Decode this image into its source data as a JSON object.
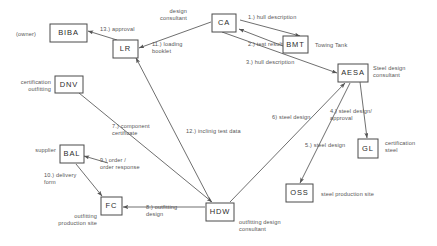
{
  "diagram": {
    "type": "node-link-diagram",
    "canvas": {
      "width": 437,
      "height": 246
    },
    "colors": {
      "background": "#ffffff",
      "node_stroke": "#4a4a4a",
      "node_fill": "#ffffff",
      "edge": "#555555",
      "text": "#555555",
      "node_text": "#2b2b2b"
    },
    "nodes": [
      {
        "id": "biba",
        "label": "BIBA",
        "role": "(owner)",
        "x": 50,
        "y": 24,
        "w": 37,
        "h": 18,
        "role_x": 16,
        "role_y": 36,
        "role_anchor": "start"
      },
      {
        "id": "lr",
        "label": "LR",
        "role": "",
        "x": 113,
        "y": 40,
        "w": 25,
        "h": 18,
        "role_x": 0,
        "role_y": 0,
        "role_anchor": "start"
      },
      {
        "id": "ca",
        "label": "CA",
        "role": "design\nconsultant",
        "x": 212,
        "y": 14,
        "w": 24,
        "h": 18,
        "role_x": 187,
        "role_y": 13,
        "role_anchor": "end"
      },
      {
        "id": "bmt",
        "label": "BMT",
        "role": "Towing Tank",
        "x": 283,
        "y": 36,
        "w": 25,
        "h": 17,
        "role_x": 315,
        "role_y": 47,
        "role_anchor": "start"
      },
      {
        "id": "aesa",
        "label": "AESA",
        "role": "Steel design\nconsultant",
        "x": 338,
        "y": 64,
        "w": 30,
        "h": 18,
        "role_x": 373,
        "role_y": 70,
        "role_anchor": "start"
      },
      {
        "id": "dnv",
        "label": "DNV",
        "role": "certification\noutfitting",
        "x": 55,
        "y": 76,
        "w": 28,
        "h": 17,
        "role_x": 51,
        "role_y": 84,
        "role_anchor": "end"
      },
      {
        "id": "bal",
        "label": "BAL",
        "role": "supplier",
        "x": 60,
        "y": 145,
        "w": 24,
        "h": 18,
        "role_x": 56,
        "role_y": 152,
        "role_anchor": "end"
      },
      {
        "id": "fc",
        "label": "FC",
        "role": "outfitting\nproduction site",
        "x": 101,
        "y": 197,
        "w": 21,
        "h": 18,
        "role_x": 97,
        "role_y": 218,
        "role_anchor": "end"
      },
      {
        "id": "hdw",
        "label": "HDW",
        "role": "outfitting design\nconsultant",
        "x": 206,
        "y": 203,
        "w": 28,
        "h": 18,
        "role_x": 239,
        "role_y": 224,
        "role_anchor": "start"
      },
      {
        "id": "oss",
        "label": "OSS",
        "role": "steel production site",
        "x": 286,
        "y": 184,
        "w": 27,
        "h": 18,
        "role_x": 321,
        "role_y": 196,
        "role_anchor": "start"
      },
      {
        "id": "gl",
        "label": "GL",
        "role": "certification\nsteel",
        "x": 358,
        "y": 139,
        "w": 20,
        "h": 19,
        "role_x": 385,
        "role_y": 145,
        "role_anchor": "start"
      }
    ],
    "edges": [
      {
        "id": "e1",
        "label": "1.) hull description",
        "from": "ca",
        "to": "bmt",
        "path": "M 240,20 L 300,36",
        "label_x": 248,
        "label_y": 19,
        "label_anchor": "start"
      },
      {
        "id": "e2",
        "label": "2.) test results",
        "from": "bmt",
        "to": "ca",
        "path": "M 283,46 L 239,29",
        "label_x": 248,
        "label_y": 46,
        "label_anchor": "start"
      },
      {
        "id": "e3",
        "label": "3.) hull description",
        "from": "ca",
        "to": "aesa",
        "path": "M 222,32 L 337,73",
        "label_x": 246,
        "label_y": 64,
        "label_anchor": "start"
      },
      {
        "id": "e4",
        "label": "4.) steel design/\napproval",
        "from": "aesa",
        "to": "gl",
        "path": "M 360,82 L 367,138",
        "label_x": 330,
        "label_y": 113,
        "label_anchor": "start"
      },
      {
        "id": "e5",
        "label": "5.) steel design",
        "from": "aesa",
        "to": "oss",
        "path": "M 350,83 L 300,183",
        "label_x": 305,
        "label_y": 147,
        "label_anchor": "start"
      },
      {
        "id": "e6",
        "label": "6) steel design",
        "from": "hdw",
        "to": "aesa",
        "path": "M 230,202 L 345,83",
        "label_x": 272,
        "label_y": 119,
        "label_anchor": "start"
      },
      {
        "id": "e7",
        "label": "7.) component\ncertificate",
        "from": "dnv",
        "to": "hdw",
        "path": "M 79,93 L 212,202",
        "label_x": 112,
        "label_y": 128,
        "label_anchor": "start"
      },
      {
        "id": "e8",
        "label": "8.) outfitting\ndesign",
        "from": "hdw",
        "to": "fc",
        "path": "M 205,207 L 123,207",
        "label_x": 146,
        "label_y": 209,
        "label_anchor": "start"
      },
      {
        "id": "e9",
        "label": "9.) order /\norder response",
        "from": "hdw",
        "to": "bal",
        "path": "M 108,163 L 84,156",
        "label_x": 100,
        "label_y": 162,
        "label_anchor": "start"
      },
      {
        "id": "e10",
        "label": "10.) delivery\nform",
        "from": "bal",
        "to": "fc",
        "path": "M 76,164 L 102,196",
        "label_x": 44,
        "label_y": 177,
        "label_anchor": "start"
      },
      {
        "id": "e11",
        "label": "11.) loading\nbooklet",
        "from": "ca",
        "to": "lr",
        "path": "M 211,22 L 139,48",
        "label_x": 152,
        "label_y": 46,
        "label_anchor": "start"
      },
      {
        "id": "e12",
        "label": "12.) inclinig test data",
        "from": "hdw",
        "to": "lr",
        "path": "M 211,202 L 136,58",
        "label_x": 186,
        "label_y": 133,
        "label_anchor": "start"
      },
      {
        "id": "e13",
        "label": "13.) approval",
        "from": "lr",
        "to": "biba",
        "path": "M 117,40 L 88,31",
        "label_x": 100,
        "label_y": 31,
        "label_anchor": "start"
      }
    ]
  }
}
